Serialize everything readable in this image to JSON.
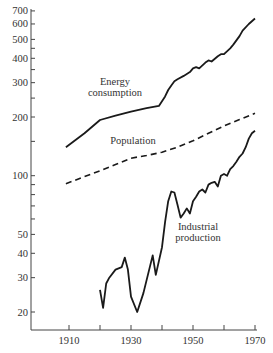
{
  "chart_data": {
    "type": "line",
    "title": "",
    "xlabel": "",
    "ylabel": "",
    "yscale": "log",
    "xlim": [
      1900,
      1970
    ],
    "ylim": [
      15,
      720
    ],
    "grid": false,
    "x_ticks": [
      1910,
      1920,
      1930,
      1940,
      1950,
      1960,
      1970
    ],
    "x_tick_labels": [
      "1910",
      "",
      "1930",
      "",
      "1950",
      "",
      "1970"
    ],
    "y_ticks": [
      20,
      30,
      40,
      50,
      60,
      70,
      80,
      90,
      100,
      150,
      200,
      250,
      300,
      350,
      400,
      450,
      500,
      600,
      700
    ],
    "y_tick_labels": [
      "20",
      "30",
      "40",
      "50",
      "",
      "",
      "",
      "",
      "100",
      "",
      "200",
      "",
      "300",
      "",
      "400",
      "",
      "500",
      "600",
      "700"
    ],
    "series": [
      {
        "name": "Energy consumption",
        "style": "solid",
        "label": [
          "Energy",
          "consumption"
        ],
        "x": [
          1909,
          1915,
          1920,
          1925,
          1930,
          1935,
          1939,
          1941,
          1942,
          1943,
          1944,
          1945,
          1947,
          1949,
          1950,
          1951,
          1952,
          1954,
          1955,
          1956,
          1958,
          1959,
          1960,
          1962,
          1963,
          1965,
          1966,
          1968,
          1970
        ],
        "values": [
          140,
          165,
          193,
          203,
          213,
          222,
          228,
          255,
          275,
          290,
          305,
          312,
          325,
          340,
          355,
          360,
          355,
          380,
          390,
          385,
          410,
          420,
          420,
          450,
          470,
          520,
          555,
          600,
          640
        ]
      },
      {
        "name": "Population",
        "style": "dashed",
        "label": [
          "Population"
        ],
        "x": [
          1909,
          1915,
          1920,
          1925,
          1930,
          1935,
          1940,
          1945,
          1950,
          1955,
          1960,
          1965,
          1970
        ],
        "values": [
          91,
          99,
          106,
          114,
          123,
          127,
          132,
          140,
          151,
          165,
          180,
          194,
          209
        ]
      },
      {
        "name": "Industrial production",
        "style": "solid",
        "label": [
          "Industrial",
          "production"
        ],
        "x": [
          1920,
          1921,
          1922,
          1923,
          1925,
          1927,
          1928,
          1929,
          1930,
          1932,
          1934,
          1937,
          1938,
          1940,
          1941,
          1942,
          1943,
          1944,
          1945,
          1946,
          1947,
          1948,
          1949,
          1950,
          1951,
          1952,
          1953,
          1954,
          1955,
          1956,
          1957,
          1958,
          1959,
          1960,
          1961,
          1962,
          1963,
          1964,
          1965,
          1966,
          1967,
          1968,
          1969,
          1970
        ],
        "values": [
          26,
          21,
          28,
          30,
          33,
          34,
          38,
          33,
          24,
          20,
          25,
          39,
          31,
          43,
          58,
          74,
          83,
          82,
          71,
          61,
          64,
          68,
          64,
          74,
          78,
          83,
          85,
          82,
          90,
          92,
          93,
          88,
          100,
          102,
          100,
          108,
          112,
          118,
          125,
          130,
          140,
          155,
          165,
          170
        ]
      }
    ]
  }
}
